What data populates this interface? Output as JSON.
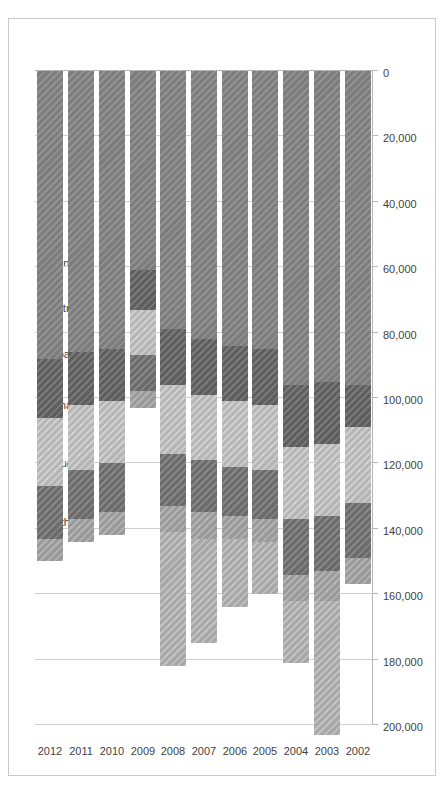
{
  "chart_data": {
    "type": "bar",
    "subtype": "stacked-horizontal",
    "title": "",
    "xlabel": "",
    "ylabel": "",
    "orientation": "rotated-90",
    "grid": true,
    "legend_position": "top",
    "axis": {
      "ticks": [
        "200,000",
        "180,000",
        "160,000",
        "140,000",
        "120,000",
        "100,000",
        "80,000",
        "60,000",
        "40,000",
        "20,000",
        "0"
      ],
      "tick_values": [
        200000,
        180000,
        160000,
        140000,
        120000,
        100000,
        80000,
        60000,
        40000,
        20000,
        0
      ],
      "min": 0,
      "max": 200000,
      "reversed": true,
      "step": 20000
    },
    "categories": [
      "2012",
      "2011",
      "2010",
      "2009",
      "2008",
      "2007",
      "2006",
      "2005",
      "2004",
      "2003",
      "2002"
    ],
    "series": [
      {
        "name": "China",
        "key": "china",
        "color": "#7d7d7d",
        "values": [
          88000,
          86000,
          85000,
          61000,
          79000,
          82000,
          84000,
          85000,
          96000,
          95000,
          96000
        ]
      },
      {
        "name": "Austria",
        "key": "austria",
        "color": "#5e5e5e",
        "values": [
          18000,
          16000,
          16000,
          12000,
          17000,
          17000,
          17000,
          17000,
          19000,
          19000,
          13000
        ]
      },
      {
        "name": "Japan",
        "key": "japan",
        "color": "#b6b6b6",
        "values": [
          21000,
          20000,
          19000,
          14000,
          21000,
          20000,
          20000,
          20000,
          22000,
          22000,
          23000
        ]
      },
      {
        "name": "Germany",
        "key": "germany",
        "color": "#6b6b6b",
        "values": [
          16000,
          15000,
          15000,
          11000,
          16000,
          16000,
          15000,
          15000,
          17000,
          17000,
          17000
        ]
      },
      {
        "name": "Portugal",
        "key": "portugal",
        "color": "#9a9a9a",
        "values": [
          7000,
          7000,
          7000,
          5000,
          8000,
          8000,
          7000,
          7000,
          8000,
          9000,
          8000
        ]
      },
      {
        "name": "All Others",
        "key": "allothers",
        "color": "#a8a8a8",
        "values": [
          0,
          0,
          0,
          0,
          41000,
          32000,
          21000,
          16000,
          19000,
          41000,
          0
        ]
      }
    ],
    "totals": [
      150000,
      144000,
      142000,
      103000,
      182000,
      175000,
      164000,
      160000,
      181000,
      203000,
      157000
    ],
    "legend": [
      {
        "label": "All Others",
        "color": "#a8a8a8"
      },
      {
        "label": "Portugal",
        "color": "#9a9a9a"
      },
      {
        "label": "Germany",
        "color": "#6b6b6b"
      },
      {
        "label": "Japan",
        "color": "#b6b6b6"
      },
      {
        "label": "Austria",
        "color": "#5e5e5e"
      },
      {
        "label": "China",
        "color": "#7d7d7d"
      }
    ]
  }
}
